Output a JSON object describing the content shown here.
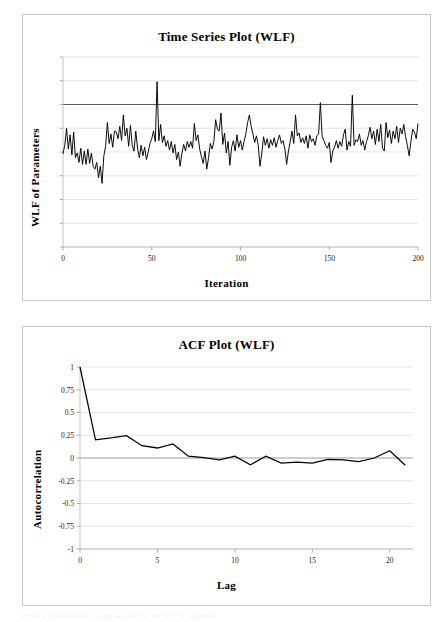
{
  "page": {
    "background_color": "#ffffff",
    "width": 445,
    "height": 622,
    "footer_smudge": "Figure 4.12   Time series plot and ACF plot for the WLF of parameters"
  },
  "panels": {
    "timeseries": {
      "title": "Time Series Plot (WLF)",
      "xlabel": "Iteration",
      "ylabel": "WLF of Parameters"
    },
    "acf": {
      "title": "ACF Plot (WLF)",
      "xlabel": "Lag",
      "ylabel": "Autocorrelation"
    }
  },
  "chart_data": [
    {
      "type": "line",
      "id": "time-series-wlf",
      "title": "Time Series Plot (WLF)",
      "xlabel": "Iteration",
      "ylabel": "WLF of Parameters",
      "xlim": [
        0,
        200
      ],
      "ylim": [
        0,
        10
      ],
      "xticks": [
        0,
        50,
        100,
        150,
        200
      ],
      "xtick_labels": [
        "0",
        "50",
        "100",
        "150",
        "200"
      ],
      "yticks": [
        0,
        1.25,
        2.5,
        3.75,
        5,
        6.25,
        7.5,
        8.75,
        10
      ],
      "ytick_labels": [
        "",
        "",
        "",
        "",
        "",
        "",
        "",
        "",
        ""
      ],
      "grid": true,
      "grid_color": "#d9d9d9",
      "legend": "none",
      "line_color": "#000000",
      "reference_line": {
        "y": 7.5,
        "color": "#595959",
        "note": "darker horizontal gridline near upper region"
      },
      "x": [
        0,
        1,
        2,
        3,
        4,
        5,
        6,
        7,
        8,
        9,
        10,
        11,
        12,
        13,
        14,
        15,
        16,
        17,
        18,
        19,
        20,
        21,
        22,
        23,
        24,
        25,
        26,
        27,
        28,
        29,
        30,
        31,
        32,
        33,
        34,
        35,
        36,
        37,
        38,
        39,
        40,
        41,
        42,
        43,
        44,
        45,
        46,
        47,
        48,
        49,
        50,
        51,
        52,
        53,
        54,
        55,
        56,
        57,
        58,
        59,
        60,
        61,
        62,
        63,
        64,
        65,
        66,
        67,
        68,
        69,
        70,
        71,
        72,
        73,
        74,
        75,
        76,
        77,
        78,
        79,
        80,
        81,
        82,
        83,
        84,
        85,
        86,
        87,
        88,
        89,
        90,
        91,
        92,
        93,
        94,
        95,
        96,
        97,
        98,
        99,
        100,
        101,
        102,
        103,
        104,
        105,
        106,
        107,
        108,
        109,
        110,
        111,
        112,
        113,
        114,
        115,
        116,
        117,
        118,
        119,
        120,
        121,
        122,
        123,
        124,
        125,
        126,
        127,
        128,
        129,
        130,
        131,
        132,
        133,
        134,
        135,
        136,
        137,
        138,
        139,
        140,
        141,
        142,
        143,
        144,
        145,
        146,
        147,
        148,
        149,
        150,
        151,
        152,
        153,
        154,
        155,
        156,
        157,
        158,
        159,
        160,
        161,
        162,
        163,
        164,
        165,
        166,
        167,
        168,
        169,
        170,
        171,
        172,
        173,
        174,
        175,
        176,
        177,
        178,
        179,
        180,
        181,
        182,
        183,
        184,
        185,
        186,
        187,
        188,
        189,
        190,
        191,
        192,
        193,
        194,
        195,
        196,
        197,
        198,
        199,
        200
      ],
      "values": [
        4.9,
        5.35,
        6.25,
        5.15,
        5.9,
        4.85,
        6.05,
        4.7,
        4.95,
        4.45,
        5.2,
        4.35,
        5.05,
        4.35,
        5.15,
        4.4,
        4.95,
        4.25,
        4.1,
        4.45,
        3.65,
        4.25,
        3.35,
        4.8,
        5.3,
        6.55,
        5.45,
        5.95,
        5.25,
        6.1,
        6.05,
        5.7,
        6.35,
        5.6,
        6.95,
        5.85,
        6.25,
        5.3,
        6.4,
        5.35,
        5.05,
        6.1,
        5.2,
        4.7,
        5.35,
        4.8,
        5.25,
        4.6,
        5.0,
        5.45,
        5.7,
        6.1,
        5.55,
        8.7,
        5.6,
        6.45,
        5.5,
        5.85,
        5.3,
        5.6,
        5.1,
        5.55,
        4.95,
        5.4,
        4.6,
        5.0,
        4.25,
        4.95,
        5.4,
        5.05,
        5.55,
        5.25,
        5.55,
        5.2,
        6.5,
        5.6,
        5.9,
        5.15,
        4.75,
        4.4,
        5.05,
        4.1,
        4.7,
        5.45,
        5.15,
        5.55,
        6.7,
        6.2,
        6.1,
        7.05,
        5.4,
        6.0,
        4.95,
        5.55,
        4.3,
        5.25,
        5.6,
        5.05,
        5.9,
        5.25,
        5.6,
        5.1,
        5.55,
        5.95,
        6.55,
        6.95,
        6.35,
        5.95,
        5.5,
        5.85,
        5.35,
        4.25,
        4.95,
        5.8,
        5.35,
        5.7,
        5.2,
        5.65,
        5.35,
        5.75,
        5.25,
        5.6,
        5.9,
        5.45,
        5.6,
        5.15,
        4.35,
        5.05,
        5.55,
        6.1,
        5.45,
        6.95,
        5.85,
        6.0,
        5.5,
        5.75,
        5.45,
        5.85,
        5.2,
        5.9,
        5.55,
        5.7,
        5.35,
        5.85,
        5.95,
        7.6,
        5.8,
        5.6,
        5.35,
        5.2,
        5.5,
        4.45,
        5.05,
        5.25,
        5.6,
        5.2,
        5.55,
        5.3,
        5.9,
        6.2,
        5.1,
        5.55,
        5.3,
        8.0,
        5.35,
        5.65,
        5.55,
        5.95,
        5.35,
        5.6,
        5.1,
        5.55,
        5.85,
        6.3,
        5.7,
        6.1,
        5.4,
        6.2,
        5.55,
        6.45,
        5.2,
        5.05,
        6.55,
        5.75,
        6.15,
        5.45,
        6.1,
        5.7,
        6.35,
        5.5,
        6.25,
        5.95,
        6.45,
        5.8,
        5.35,
        4.8,
        5.55,
        6.2,
        6.05,
        5.7,
        6.5,
        5.8
      ]
    },
    {
      "type": "line",
      "id": "acf-wlf",
      "title": "ACF Plot (WLF)",
      "xlabel": "Lag",
      "ylabel": "Autocorrelation",
      "xlim": [
        0,
        21.5
      ],
      "ylim": [
        -1,
        1
      ],
      "xticks": [
        0,
        5,
        10,
        15,
        20
      ],
      "xtick_labels": [
        "0",
        "5",
        "10",
        "15",
        "20"
      ],
      "yticks": [
        -1,
        -0.75,
        -0.5,
        -0.25,
        0,
        0.25,
        0.5,
        0.75,
        1
      ],
      "ytick_labels": [
        "-1",
        "-0.75",
        "-0.5",
        "-0.25",
        "0",
        "0.25",
        "0.5",
        "0.75",
        "1"
      ],
      "grid": true,
      "grid_color": "#d9d9d9",
      "legend": "none",
      "line_color": "#000000",
      "x": [
        0,
        1,
        2,
        3,
        4,
        5,
        6,
        7,
        8,
        9,
        10,
        11,
        12,
        13,
        14,
        15,
        16,
        17,
        18,
        19,
        20,
        21
      ],
      "values": [
        1.0,
        0.2,
        0.22,
        0.245,
        0.135,
        0.11,
        0.155,
        0.02,
        0.005,
        -0.02,
        0.02,
        -0.075,
        0.02,
        -0.055,
        -0.045,
        -0.055,
        -0.015,
        -0.02,
        -0.04,
        0.0,
        0.08,
        -0.08
      ]
    }
  ]
}
